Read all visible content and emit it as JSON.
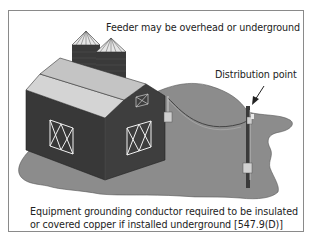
{
  "figure": {
    "type": "illustration",
    "labels": {
      "feeder": "Feeder may be overhead or underground",
      "distribution_point": "Distribution point",
      "note_line1": "Equipment grounding conductor required to be insulated",
      "note_line2": "or covered copper if installed underground [547.9(D)]"
    },
    "elements": [
      "ground-shadow",
      "silo-left",
      "silo-right",
      "barn",
      "barn-door-left",
      "barn-door-right",
      "hayloft-door",
      "service-panel",
      "feeder-cable",
      "utility-pole",
      "pole-meter",
      "arrow"
    ],
    "colors": {
      "frame": "#8a8a8a",
      "ground": "#8c8c8c",
      "barn_wall": "#3a3a3a",
      "roof": "#d0d0d0",
      "text": "#222222"
    }
  }
}
